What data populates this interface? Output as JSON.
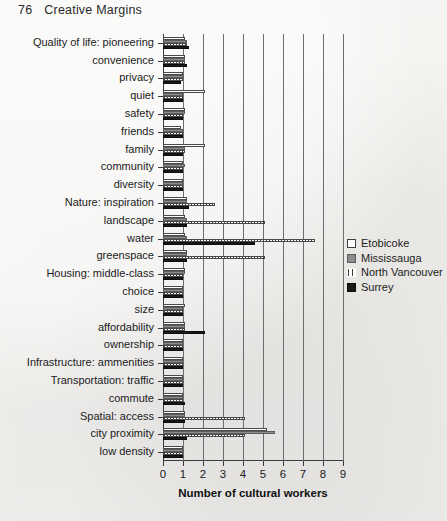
{
  "page": {
    "folio": "76",
    "running_head": "Creative Margins"
  },
  "legend": {
    "position": "right",
    "items": [
      {
        "label": "Etobicoke",
        "key": "etobicoke",
        "swatch": "white-outline",
        "color": "#ffffff"
      },
      {
        "label": "Mississauga",
        "key": "mississauga",
        "swatch": "gray-fill",
        "color": "#8c8c8c"
      },
      {
        "label": "North Vancouver",
        "key": "northvan",
        "swatch": "vertical-stripes",
        "color": "#3d3d3d"
      },
      {
        "label": "Surrey",
        "key": "surrey",
        "swatch": "black-fill",
        "color": "#1a1a1a"
      }
    ]
  },
  "chart_data": {
    "type": "bar",
    "orientation": "horizontal",
    "title": "",
    "subtitle": "",
    "xlabel": "Number of cultural workers",
    "ylabel": "",
    "xlim": [
      0,
      9
    ],
    "xticks": [
      0,
      1,
      2,
      3,
      4,
      5,
      6,
      7,
      8,
      9
    ],
    "xticklabels": [
      "0",
      "1",
      "2",
      "3",
      "4",
      "5",
      "6",
      "7",
      "8",
      "9"
    ],
    "grid": "vertical",
    "legend_position": "right",
    "categories": [
      "Quality of life:  pioneering",
      "convenience",
      "privacy",
      "quiet",
      "safety",
      "friends",
      "family",
      "community",
      "diversity",
      "Nature:  inspiration",
      "landscape",
      "water",
      "greenspace",
      "Housing:  middle-class",
      "choice",
      "size",
      "affordability",
      "ownership",
      "Infrastructure:  ammenities",
      "Transportation:  traffic",
      "commute",
      "Spatial:  access",
      "city proximity",
      "low density"
    ],
    "series": [
      {
        "name": "Etobicoke",
        "values": [
          1.1,
          1.1,
          1.0,
          2.1,
          1.1,
          0.9,
          2.1,
          1.0,
          1.0,
          1.2,
          1.1,
          1.1,
          1.2,
          1.1,
          1.0,
          1.1,
          1.1,
          1.0,
          1.0,
          1.0,
          1.0,
          1.1,
          5.2,
          1.0
        ]
      },
      {
        "name": "Mississauga",
        "values": [
          1.2,
          1.1,
          1.0,
          1.0,
          1.1,
          1.0,
          1.1,
          1.1,
          1.0,
          1.2,
          1.2,
          1.2,
          1.2,
          1.1,
          1.0,
          1.0,
          1.1,
          1.0,
          1.0,
          1.0,
          1.0,
          1.1,
          5.6,
          1.0
        ]
      },
      {
        "name": "North Vancouver",
        "values": [
          1.2,
          1.1,
          1.0,
          1.0,
          1.0,
          1.0,
          1.1,
          1.0,
          1.0,
          2.6,
          5.1,
          7.6,
          5.1,
          1.0,
          1.0,
          1.0,
          1.1,
          1.0,
          1.0,
          1.0,
          1.0,
          4.1,
          4.1,
          1.0
        ]
      },
      {
        "name": "Surrey",
        "values": [
          1.3,
          1.2,
          0.9,
          1.0,
          1.0,
          1.0,
          1.0,
          1.0,
          1.0,
          1.3,
          1.2,
          4.6,
          1.2,
          1.0,
          1.0,
          1.0,
          2.1,
          1.0,
          1.0,
          1.0,
          1.1,
          1.1,
          1.2,
          1.0
        ]
      }
    ]
  }
}
